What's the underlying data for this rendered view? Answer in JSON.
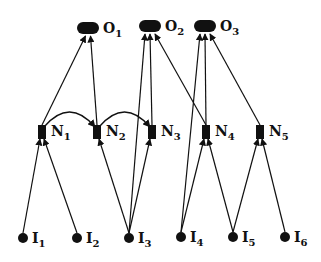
{
  "diagram": {
    "type": "neural-network-graph",
    "colors": {
      "ink": "#111111",
      "background": "#ffffff"
    },
    "nodes": {
      "outputs": [
        {
          "id": "O1",
          "base": "O",
          "sub": "1",
          "x": 88,
          "y": 29
        },
        {
          "id": "O2",
          "base": "O",
          "sub": "2",
          "x": 150,
          "y": 27
        },
        {
          "id": "O3",
          "base": "O",
          "sub": "3",
          "x": 205,
          "y": 27
        }
      ],
      "hidden": [
        {
          "id": "N1",
          "base": "N",
          "sub": "1",
          "x": 42,
          "y": 132
        },
        {
          "id": "N2",
          "base": "N",
          "sub": "2",
          "x": 97,
          "y": 132
        },
        {
          "id": "N3",
          "base": "N",
          "sub": "3",
          "x": 152,
          "y": 132
        },
        {
          "id": "N4",
          "base": "N",
          "sub": "4",
          "x": 206,
          "y": 132
        },
        {
          "id": "N5",
          "base": "N",
          "sub": "5",
          "x": 260,
          "y": 132
        }
      ],
      "inputs": [
        {
          "id": "I1",
          "base": "I",
          "sub": "1",
          "x": 23,
          "y": 238
        },
        {
          "id": "I2",
          "base": "I",
          "sub": "2",
          "x": 77,
          "y": 238
        },
        {
          "id": "I3",
          "base": "I",
          "sub": "3",
          "x": 129,
          "y": 238
        },
        {
          "id": "I4",
          "base": "I",
          "sub": "4",
          "x": 181,
          "y": 237
        },
        {
          "id": "I5",
          "base": "I",
          "sub": "5",
          "x": 233,
          "y": 237
        },
        {
          "id": "I6",
          "base": "I",
          "sub": "6",
          "x": 285,
          "y": 237
        }
      ]
    },
    "edges": [
      {
        "from": "I1",
        "to": "N1"
      },
      {
        "from": "I2",
        "to": "N1"
      },
      {
        "from": "I3",
        "to": "N2"
      },
      {
        "from": "I3",
        "to": "O2"
      },
      {
        "from": "I3",
        "to": "N3"
      },
      {
        "from": "I4",
        "to": "O3"
      },
      {
        "from": "I4",
        "to": "N4"
      },
      {
        "from": "I5",
        "to": "N4"
      },
      {
        "from": "I5",
        "to": "N5"
      },
      {
        "from": "I6",
        "to": "N5"
      },
      {
        "from": "N1",
        "to": "O1"
      },
      {
        "from": "N2",
        "to": "O1"
      },
      {
        "from": "N3",
        "to": "O2"
      },
      {
        "from": "N4",
        "to": "O2"
      },
      {
        "from": "N4",
        "to": "O3"
      },
      {
        "from": "N5",
        "to": "O3"
      },
      {
        "from": "N1",
        "to": "N2",
        "curved": true
      },
      {
        "from": "N2",
        "to": "N3",
        "curved": true
      }
    ]
  }
}
